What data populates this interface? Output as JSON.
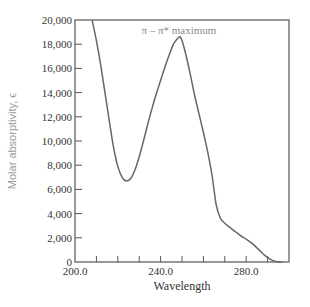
{
  "chart_data": {
    "type": "line",
    "title": "",
    "xlabel": "Wavelength",
    "ylabel": "Molar absorptivity, ϵ",
    "xlim": [
      200,
      300
    ],
    "ylim": [
      0,
      20000
    ],
    "x_tick_labels": [
      "200.0",
      "240.0",
      "280.0"
    ],
    "x_tick_values": [
      200,
      240,
      280
    ],
    "x_minor_ticks": [
      210,
      220,
      230,
      240,
      250,
      260,
      270,
      280,
      290
    ],
    "y_tick_labels": [
      "0",
      "2,000",
      "4,000",
      "6,000",
      "8,000",
      "10,000",
      "12,000",
      "14,000",
      "16,000",
      "18,000",
      "20,000"
    ],
    "y_tick_values": [
      0,
      2000,
      4000,
      6000,
      8000,
      10000,
      12000,
      14000,
      16000,
      18000,
      20000
    ],
    "grid": false,
    "legend": null,
    "annotations": [
      {
        "text": "π – π* maximum",
        "x": 249,
        "y": 19200
      }
    ],
    "series": [
      {
        "name": "absorbance spectrum",
        "x": [
          208,
          210,
          212,
          214,
          216,
          218,
          220,
          222,
          224,
          226,
          228,
          230,
          232,
          234,
          236,
          238,
          240,
          242,
          244,
          246,
          248,
          249,
          250,
          252,
          254,
          256,
          258,
          260,
          262,
          264,
          266,
          268,
          270,
          272,
          275,
          278,
          280,
          283,
          286,
          289,
          292,
          295,
          297
        ],
        "y": [
          20000,
          18300,
          16300,
          14000,
          11700,
          9500,
          7900,
          7000,
          6700,
          6900,
          7600,
          8700,
          10000,
          11400,
          12700,
          13900,
          15000,
          16100,
          17100,
          18000,
          18500,
          18600,
          18300,
          17000,
          15400,
          13700,
          12200,
          10700,
          9100,
          7200,
          4700,
          3600,
          3200,
          2900,
          2500,
          2100,
          1900,
          1500,
          1000,
          500,
          150,
          0,
          0
        ]
      }
    ]
  },
  "colors": {
    "axis": "#555555",
    "curve": "#666666",
    "ylabel": "#9a9a9a",
    "annotation": "#8a8a8a"
  }
}
